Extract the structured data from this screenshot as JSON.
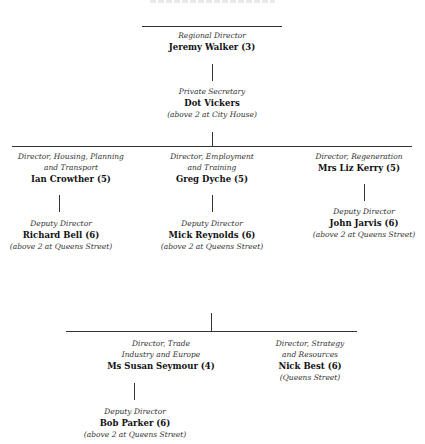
{
  "chart": {
    "type": "org-chart",
    "top_clipped_text": "",
    "nodes": {
      "regional_director": {
        "role": "Regional Director",
        "name": "Jeremy Walker (3)"
      },
      "private_secretary": {
        "role": "Private Secretary",
        "name": "Dot Vickers",
        "location": "(above 2 at City House)"
      },
      "dir_housing": {
        "role": "Director, Housing, Planning\nand Transport",
        "name": "Ian Crowther (5)"
      },
      "dir_employment": {
        "role": "Director, Employment\nand Training",
        "name": "Greg Dyche (5)"
      },
      "dir_regeneration": {
        "role": "Director, Regeneration",
        "name": "Mrs Liz Kerry (5)"
      },
      "deputy_housing": {
        "role": "Deputy Director",
        "name": "Richard Bell (6)",
        "location": "(above 2 at Queens Street)"
      },
      "deputy_employment": {
        "role": "Deputy Director",
        "name": "Mick Reynolds (6)",
        "location": "(above 2 at Queens Street)"
      },
      "deputy_regeneration": {
        "role": "Deputy Director",
        "name": "John Jarvis (6)",
        "location": "(above 2 at Queens Street)"
      },
      "dir_trade": {
        "role": "Director, Trade\nIndustry and Europe",
        "name": "Ms Susan Seymour (4)"
      },
      "dir_strategy": {
        "role": "Director, Strategy\nand Resources",
        "name": "Nick Best (6)",
        "location": "(Queens Street)"
      },
      "deputy_trade": {
        "role": "Deputy Director",
        "name": "Bob Parker (6)",
        "location": "(above 2 at Queens Street)"
      }
    }
  }
}
